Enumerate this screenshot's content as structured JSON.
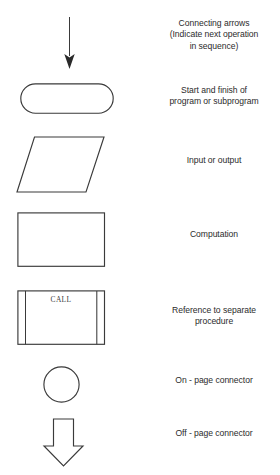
{
  "diagram": {
    "stroke_color": "#3a3a3a",
    "text_color": "#2b2b2b",
    "background_color": "#ffffff",
    "rows": [
      {
        "symbol": "connecting-arrow",
        "label": "Connecting arrows\n(Indicate next operation\nin sequence)"
      },
      {
        "symbol": "terminator-rounded-rectangle",
        "label": "Start and finish of\nprogram or subprogram"
      },
      {
        "symbol": "parallelogram",
        "label": "Input or output"
      },
      {
        "symbol": "rectangle",
        "label": "Computation"
      },
      {
        "symbol": "predefined-process",
        "label": "Reference to separate\nprocedure",
        "inner_text": "CALL"
      },
      {
        "symbol": "circle",
        "label": "On - page connector"
      },
      {
        "symbol": "block-arrow-down",
        "label": "Off - page connector"
      }
    ]
  }
}
